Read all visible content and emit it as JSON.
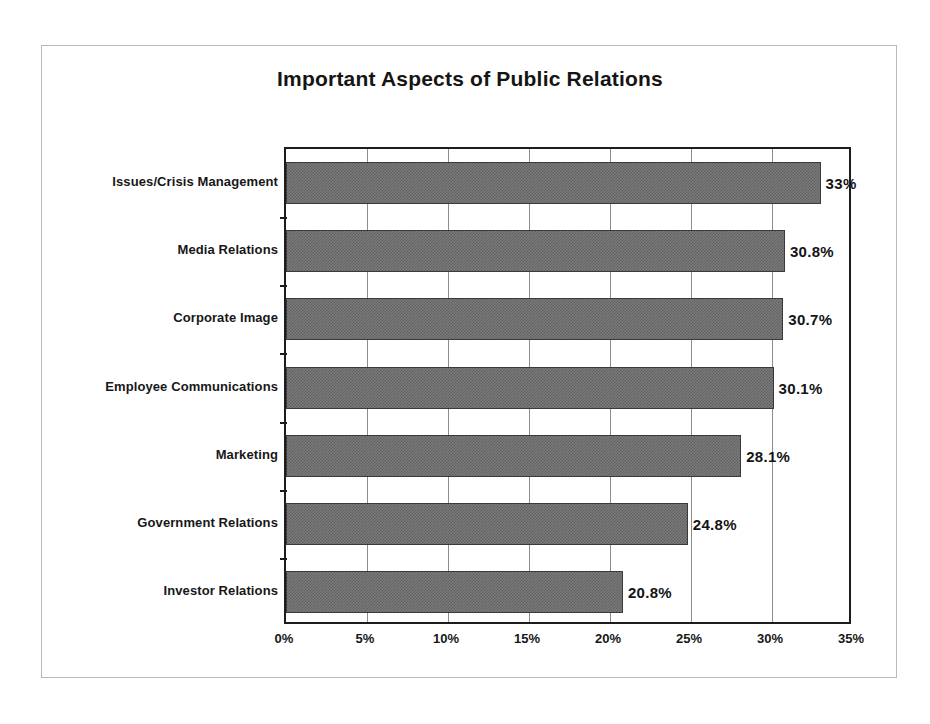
{
  "chart_data": {
    "type": "bar",
    "orientation": "horizontal",
    "title": "Important Aspects of Public Relations",
    "xlabel": "",
    "ylabel": "",
    "xlim": [
      0,
      35
    ],
    "xtick_labels": [
      "0%",
      "5%",
      "10%",
      "15%",
      "20%",
      "25%",
      "30%",
      "35%"
    ],
    "xtick_values": [
      0,
      5,
      10,
      15,
      20,
      25,
      30,
      35
    ],
    "grid": true,
    "legend": false,
    "categories": [
      "Issues/Crisis Management",
      "Media Relations",
      "Corporate Image",
      "Employee Communications",
      "Marketing",
      "Government Relations",
      "Investor Relations"
    ],
    "values": [
      33,
      30.8,
      30.7,
      30.1,
      28.1,
      24.8,
      20.8
    ],
    "value_labels": [
      "33%",
      "30.8%",
      "30.7%",
      "30.1%",
      "28.1%",
      "24.8%",
      "20.8%"
    ],
    "bar_color": "#7b7b7b",
    "bar_edge_color": "#3a3a3a",
    "axis_color": "#1d1d1d",
    "gridline_color": "#8d8d8d",
    "background_color": "#ffffff",
    "text_color": "#141414"
  }
}
